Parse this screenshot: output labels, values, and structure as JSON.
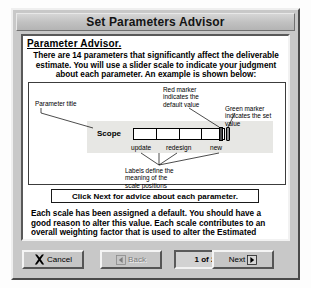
{
  "window": {
    "title": "Set Parameters Advisor"
  },
  "content": {
    "heading": "Parameter Advisor.",
    "intro_paragraph": "There are 14 parameters that significantly affect the deliverable estimate. You will use a slider scale to indicate your judgment about each parameter. An example is shown below:",
    "cta_label": "Click Next for advice about each parameter.",
    "closing_paragraph": "Each scale has been assigned a default. You should have a good reason to alter this value. Each scale contributes to an overall weighting factor that is used to alter the Estimated Hours."
  },
  "diagram": {
    "annotation_parameter_title": "Parameter title",
    "annotation_red_marker": "Red marker\nindicates the\ndefault value",
    "annotation_green_marker": "Green marker\nindicates the set\nvalue",
    "annotation_labels": "Labels define the\nmeaning of the\nscale positions",
    "parameter_name": "Scope",
    "scale_labels": [
      "update",
      "redesign",
      "new"
    ],
    "segment_count": 4,
    "marker_default_color": "#cc2222",
    "marker_set_color": "#22aa44"
  },
  "buttonbar": {
    "cancel_label": "Cancel",
    "back_label": "Back",
    "page_indicator": "1 of 2",
    "next_label": "Next"
  }
}
